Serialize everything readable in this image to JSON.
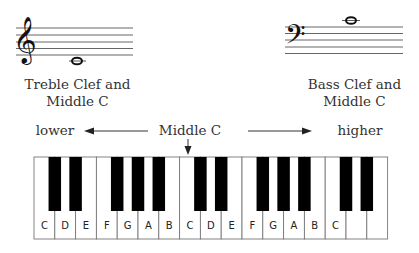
{
  "treble": {
    "label_line1": "Treble Clef and",
    "label_line2": "Middle C",
    "clef_glyph": "𝄞"
  },
  "bass": {
    "label_line1": "Bass Clef and",
    "label_line2": "Middle C",
    "clef_glyph": "𝄢"
  },
  "direction": {
    "lower": "lower",
    "middle": "Middle C",
    "higher": "higher"
  },
  "keyboard": {
    "white_keys": [
      "C",
      "D",
      "E",
      "F",
      "G",
      "A",
      "B",
      "C",
      "D",
      "E",
      "F",
      "G",
      "A",
      "B",
      "C",
      "",
      ""
    ],
    "black_after_white_index": [
      0,
      1,
      3,
      4,
      5,
      7,
      8,
      10,
      11,
      12,
      14,
      15
    ],
    "middle_c_index": 7
  }
}
